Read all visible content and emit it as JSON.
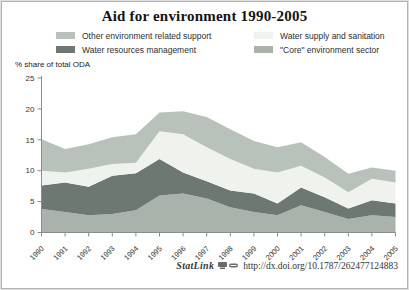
{
  "header": {
    "title": "Aid for environment 1990-2005"
  },
  "legend": {
    "items": [
      {
        "label": "Other environment related support"
      },
      {
        "label": "Water resources management"
      },
      {
        "label": "Water supply and sanitation"
      },
      {
        "label": "\"Core\" environment sector"
      }
    ]
  },
  "chart_data": {
    "type": "area",
    "stacked": true,
    "title": "Aid for environment 1990-2005",
    "ylabel": "% share of total ODA",
    "ylim": [
      0,
      25
    ],
    "yticks": [
      0,
      5,
      10,
      15,
      20,
      25
    ],
    "grid": false,
    "legend_position": "top",
    "categories": [
      1990,
      1991,
      1992,
      1993,
      1994,
      1995,
      1996,
      1997,
      1998,
      1999,
      2000,
      2001,
      2002,
      2003,
      2004,
      2005
    ],
    "series": [
      {
        "name": "\"Core\" environment sector",
        "color": "#a9b3ac",
        "values": [
          3.8,
          3.3,
          2.8,
          3.0,
          3.6,
          6.0,
          6.3,
          5.5,
          4.1,
          3.3,
          2.8,
          4.4,
          3.3,
          2.2,
          2.8,
          2.5
        ]
      },
      {
        "name": "Water resources management",
        "color": "#6d7873",
        "values": [
          3.8,
          4.8,
          4.6,
          6.2,
          6.0,
          5.9,
          3.4,
          2.8,
          2.7,
          3.0,
          1.9,
          2.9,
          2.4,
          1.7,
          2.4,
          2.2
        ]
      },
      {
        "name": "Water supply and sanitation",
        "color": "#f0f2ee",
        "values": [
          2.4,
          1.6,
          2.9,
          1.9,
          1.7,
          4.5,
          6.2,
          5.5,
          5.1,
          4.0,
          5.0,
          3.5,
          3.2,
          2.6,
          3.5,
          3.4
        ]
      },
      {
        "name": "Other environment related support",
        "color": "#b8c2bb",
        "values": [
          5.1,
          3.8,
          4.0,
          4.3,
          4.6,
          3.0,
          3.7,
          4.9,
          4.8,
          4.5,
          4.1,
          3.8,
          3.3,
          3.0,
          1.8,
          1.9
        ]
      }
    ]
  },
  "footer": {
    "statlink": "StatLink",
    "url": "http://dx.doi.org/10.1787/262477124883"
  },
  "colors": {
    "axis": "#8c8c8c",
    "tick_label": "#333333",
    "frame_border": "#b2b2b2"
  }
}
